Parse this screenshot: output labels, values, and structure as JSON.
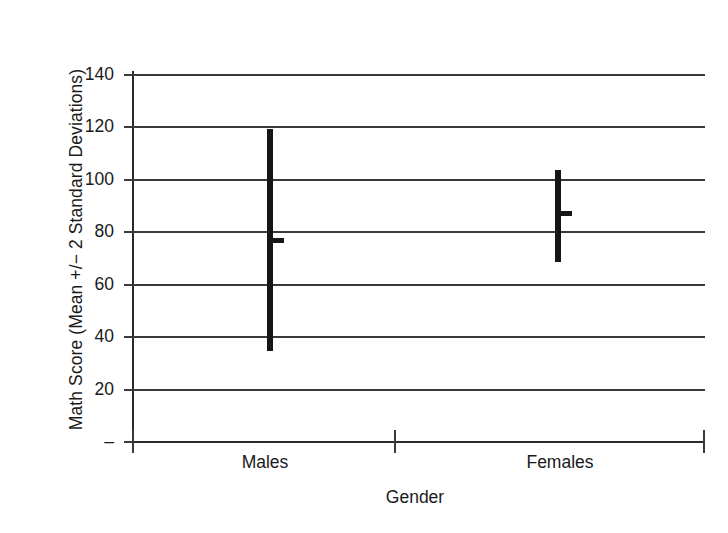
{
  "chart_data": {
    "type": "scatter",
    "title": "",
    "xlabel": "Gender",
    "ylabel": "Math Score (Mean +/− 2 Standard Deviations)",
    "categories": [
      "Males",
      "Females"
    ],
    "ylim": [
      0,
      140
    ],
    "ytick_values": [
      0,
      20,
      40,
      60,
      80,
      100,
      120,
      140
    ],
    "ytick_labels": [
      "–",
      "20",
      "40",
      "60",
      "80",
      "100",
      "120",
      "140"
    ],
    "grid": true,
    "legend": "none",
    "series": [
      {
        "name": "Mean",
        "values": [
          76.5,
          87.0
        ]
      },
      {
        "name": "Lower (Mean - 2 SD)",
        "values": [
          34.5,
          68.5
        ]
      },
      {
        "name": "Upper (Mean + 2 SD)",
        "values": [
          119.0,
          103.5
        ]
      }
    ],
    "points": [
      {
        "category": "Males",
        "mean": 76.5,
        "lower": 34.5,
        "upper": 119.0
      },
      {
        "category": "Females",
        "mean": 87.0,
        "lower": 68.5,
        "upper": 103.5
      }
    ],
    "colors": {
      "marker": "#161616",
      "grid": "#3a3a3a",
      "axis": "#2b2b2b",
      "background": "#ffffff",
      "text": "#1a1a1a"
    }
  },
  "axes": {
    "y_title": "Math Score (Mean +/− 2 Standard Deviations)",
    "x_title": "Gender",
    "y_labels": {
      "t140": "140",
      "t120": "120",
      "t100": "100",
      "t80": "80",
      "t60": "60",
      "t40": "40",
      "t20": "20",
      "t0": "–"
    },
    "x_labels": {
      "males": "Males",
      "females": "Females"
    }
  }
}
